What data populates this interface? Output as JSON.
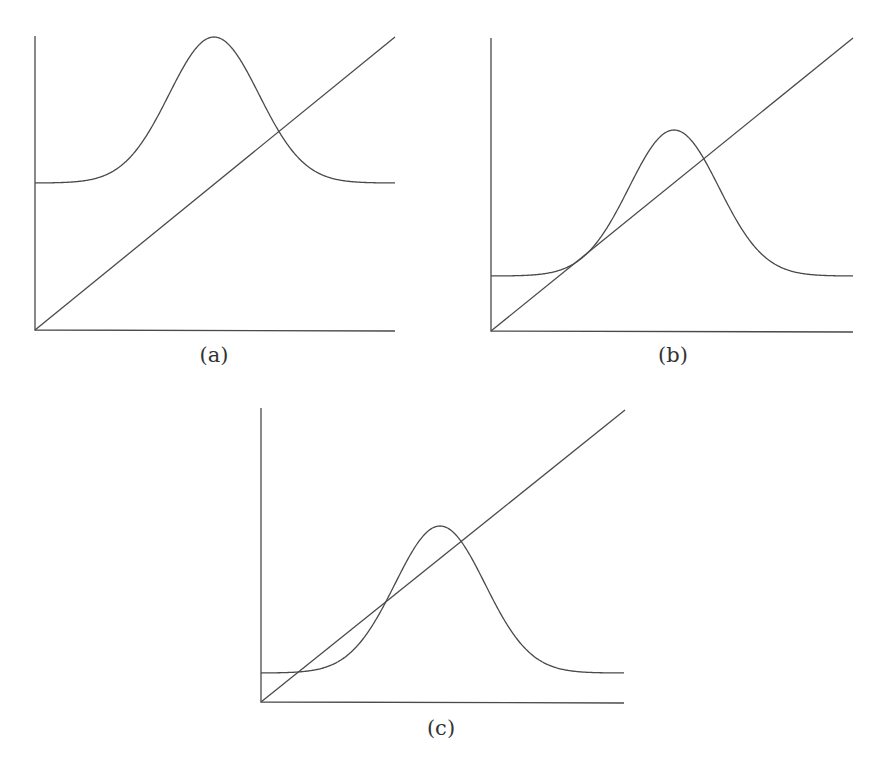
{
  "figure": {
    "panels": [
      {
        "id": "a",
        "label": "(a)",
        "origin": [
          35,
          330
        ],
        "x_axis_end": 395,
        "y_axis_top": 36,
        "line_end": [
          395,
          37
        ],
        "gaussian": {
          "baseline_y": 183,
          "peak_y": 37,
          "center_x": 214,
          "sigma": 45
        },
        "label_pos": [
          214,
          345
        ]
      },
      {
        "id": "b",
        "label": "(b)",
        "origin": [
          491,
          331
        ],
        "x_axis_end": 853,
        "y_axis_top": 38,
        "line_end": [
          853,
          38
        ],
        "gaussian": {
          "baseline_y": 276,
          "peak_y": 130,
          "center_x": 674,
          "sigma": 45
        },
        "label_pos": [
          673,
          345
        ]
      },
      {
        "id": "c",
        "label": "(c)",
        "origin": [
          261,
          702
        ],
        "x_axis_end": 624,
        "y_axis_top": 408,
        "line_end": [
          625,
          410
        ],
        "gaussian": {
          "baseline_y": 673,
          "peak_y": 526,
          "center_x": 440,
          "sigma": 45
        },
        "label_pos": [
          441,
          718
        ]
      }
    ],
    "colors": {
      "stroke": "#4a4a4a",
      "label": "#333333",
      "background": "#ffffff"
    }
  }
}
